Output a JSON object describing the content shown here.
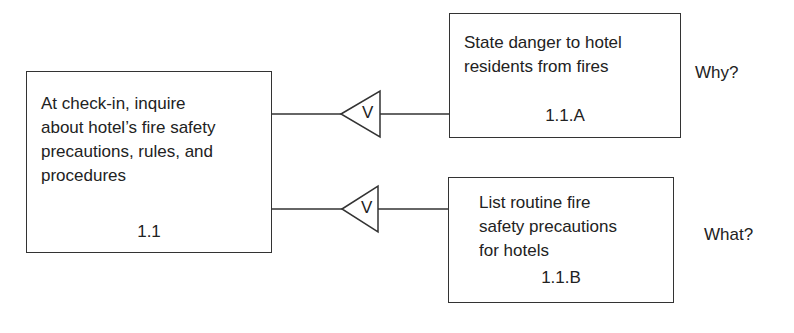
{
  "diagram": {
    "main_task": {
      "text": "At check-in, inquire\nabout hotel’s fire safety\nprecautions, rules, and\nprocedures",
      "number": "1.1"
    },
    "subtasks": [
      {
        "text": "State danger to hotel\nresidents from fires",
        "number": "1.1.A",
        "side_label": "Why?",
        "connector_label": "V"
      },
      {
        "text": "List routine fire\nsafety precautions\nfor hotels",
        "number": "1.1.B",
        "side_label": "What?",
        "connector_label": "V"
      }
    ]
  }
}
